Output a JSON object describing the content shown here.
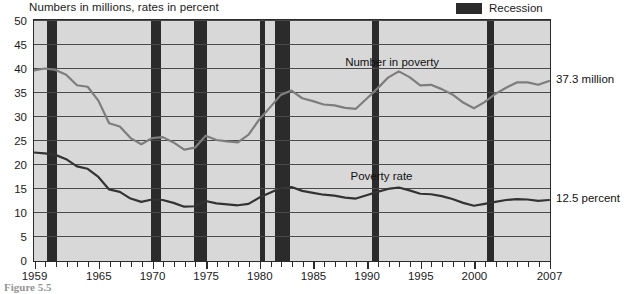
{
  "chart_title": "Numbers in millions, rates in percent",
  "caption": "Figure 5.5",
  "legend": {
    "items": [
      {
        "label": "Recession",
        "color": "#2b2b2b",
        "swatch_name": "recession-swatch"
      }
    ]
  },
  "annotations": {
    "number_in_poverty_label": "Number in poverty",
    "poverty_rate_label": "Poverty rate",
    "number_in_poverty_end": "37.3 million",
    "poverty_rate_end": "12.5 percent"
  },
  "chart_data": {
    "type": "line",
    "title": "Numbers in millions, rates in percent",
    "xlabel": "",
    "ylabel": "",
    "xlim": [
      1959,
      2007
    ],
    "ylim": [
      0,
      50
    ],
    "grid": true,
    "legend_position": "top-right",
    "y_ticks": [
      0,
      5,
      10,
      15,
      20,
      25,
      30,
      35,
      40,
      45,
      50
    ],
    "x_ticks_major": [
      1959,
      1965,
      1970,
      1975,
      1980,
      1985,
      1990,
      1995,
      2000,
      2007
    ],
    "x_tick_labels": [
      "1959",
      "1965",
      "1970",
      "1975",
      "1980",
      "1985",
      "1990",
      "1995",
      "2000",
      "2007"
    ],
    "x_tick_interval_minor": 1,
    "x": [
      1959,
      1960,
      1961,
      1962,
      1963,
      1964,
      1965,
      1966,
      1967,
      1968,
      1969,
      1970,
      1971,
      1972,
      1973,
      1974,
      1975,
      1976,
      1977,
      1978,
      1979,
      1980,
      1981,
      1982,
      1983,
      1984,
      1985,
      1986,
      1987,
      1988,
      1989,
      1990,
      1991,
      1992,
      1993,
      1994,
      1995,
      1996,
      1997,
      1998,
      1999,
      2000,
      2001,
      2002,
      2003,
      2004,
      2005,
      2006,
      2007
    ],
    "series": [
      {
        "name": "Number in poverty",
        "unit": "millions",
        "color": "#7d7d7d",
        "end_value": 37.3,
        "end_label": "37.3 million",
        "values": [
          39.5,
          39.9,
          39.6,
          38.6,
          36.4,
          36.1,
          33.2,
          28.5,
          27.8,
          25.4,
          24.1,
          25.4,
          25.6,
          24.5,
          23.0,
          23.4,
          25.9,
          25.0,
          24.7,
          24.5,
          26.1,
          29.3,
          31.8,
          34.4,
          35.3,
          33.7,
          33.1,
          32.4,
          32.2,
          31.7,
          31.5,
          33.6,
          35.7,
          38.0,
          39.3,
          38.1,
          36.4,
          36.5,
          35.6,
          34.5,
          32.8,
          31.6,
          32.9,
          34.6,
          35.9,
          37.0,
          37.0,
          36.5,
          37.3
        ]
      },
      {
        "name": "Poverty rate",
        "unit": "percent",
        "color": "#333333",
        "end_value": 12.5,
        "end_label": "12.5 percent",
        "values": [
          22.4,
          22.2,
          21.9,
          21.0,
          19.5,
          19.0,
          17.3,
          14.7,
          14.2,
          12.8,
          12.1,
          12.6,
          12.5,
          11.9,
          11.1,
          11.2,
          12.3,
          11.8,
          11.6,
          11.4,
          11.7,
          13.0,
          14.0,
          15.0,
          15.2,
          14.4,
          14.0,
          13.6,
          13.4,
          13.0,
          12.8,
          13.5,
          14.2,
          14.8,
          15.1,
          14.5,
          13.8,
          13.7,
          13.3,
          12.7,
          11.9,
          11.3,
          11.7,
          12.1,
          12.5,
          12.7,
          12.6,
          12.3,
          12.5
        ]
      }
    ],
    "recessions": [
      {
        "label": "1960-61",
        "start": 1960.2,
        "end": 1961.1
      },
      {
        "label": "1969-70",
        "start": 1969.9,
        "end": 1970.8
      },
      {
        "label": "1973-75",
        "start": 1973.9,
        "end": 1975.1
      },
      {
        "label": "1980",
        "start": 1980.1,
        "end": 1980.5
      },
      {
        "label": "1981-82",
        "start": 1981.5,
        "end": 1982.9
      },
      {
        "label": "1990-91",
        "start": 1990.5,
        "end": 1991.2
      },
      {
        "label": "2001",
        "start": 2001.2,
        "end": 2001.9
      }
    ]
  }
}
